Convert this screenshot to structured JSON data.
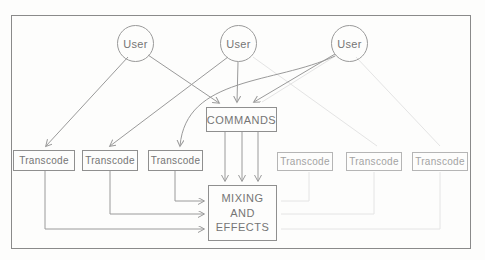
{
  "figure": {
    "nodes": {
      "users": [
        {
          "label": "User"
        },
        {
          "label": "User"
        },
        {
          "label": "User"
        }
      ],
      "commands": {
        "label": "COMMANDS"
      },
      "transcodes": [
        {
          "label": "Transcode"
        },
        {
          "label": "Transcode"
        },
        {
          "label": "Transcode"
        },
        {
          "label": "Transcode"
        },
        {
          "label": "Transcode"
        },
        {
          "label": "Transcode"
        }
      ],
      "mixing": {
        "lines": [
          "MIXING",
          "AND",
          "EFFECTS"
        ]
      }
    },
    "colors": {
      "background": "#fdfdfc",
      "frame_border": "#8a8a8a",
      "connector_line": "#9a9a9a",
      "ghost_line": "#e4e4e4",
      "box_border": "#8f8f8f",
      "box_border_idle": "#b5b5b5",
      "text": "#757575",
      "text_idle": "#a3a3a3"
    }
  }
}
